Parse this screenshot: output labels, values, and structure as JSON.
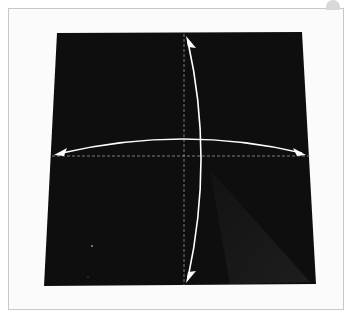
{
  "image": {
    "subject": "origami instruction step",
    "description": "Black square paper with dashed crease lines and bidirectional fold arrows (horizontal and vertical)",
    "colors": {
      "paper": "#0e0e0e",
      "background": "#fbfbfb",
      "frame": "#c8c8c8",
      "arrow": "#ffffff"
    },
    "arrows": [
      {
        "name": "horizontal-fold-arrow",
        "direction": "left-right"
      },
      {
        "name": "vertical-fold-arrow",
        "direction": "up-down"
      }
    ]
  }
}
